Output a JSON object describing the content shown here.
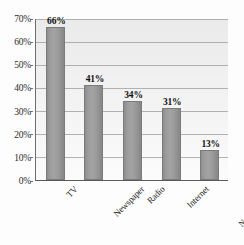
{
  "chart_data": {
    "type": "bar",
    "title": "",
    "subtitle": "",
    "xlabel": "",
    "ylabel": "",
    "categories": [
      "TV",
      "Newspaper",
      "Radio",
      "Internet",
      "Online Newspapers"
    ],
    "values": [
      66,
      41,
      34,
      31,
      13
    ],
    "data_labels": [
      "66%",
      "41%",
      "34%",
      "31%",
      "13%"
    ],
    "ylim": [
      0,
      70
    ],
    "ytick_step": 10,
    "ytick_labels": [
      "70%",
      "60%",
      "50%",
      "40%",
      "30%",
      "20%",
      "10%",
      "0%"
    ],
    "ytick_values": [
      70,
      60,
      50,
      40,
      30,
      20,
      10,
      0
    ],
    "grid": "horizontal",
    "legend": "none",
    "series": [
      {
        "name": "Percent",
        "values": [
          66,
          41,
          34,
          31,
          13
        ]
      }
    ],
    "colors": {
      "bar_fill": "#9c9c9c",
      "bar_border": "#7b7b7b",
      "plot_background": "#eeeeee",
      "gridline": "#9a9a9a",
      "axis_line": "#5a5a5a",
      "text": "#1a1a1a"
    }
  }
}
